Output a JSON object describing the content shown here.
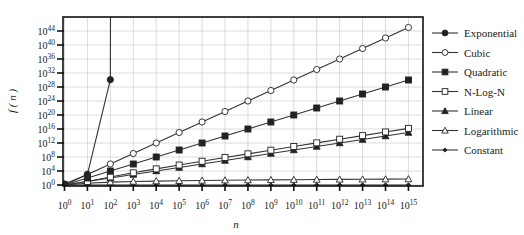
{
  "chart_data": {
    "type": "line",
    "title": "",
    "xlabel": "n",
    "ylabel": "f ( n )",
    "x_scale": "log10",
    "y_scale": "log10",
    "x": [
      0,
      1,
      2,
      3,
      4,
      5,
      6,
      7,
      8,
      9,
      10,
      11,
      12,
      13,
      14,
      15
    ],
    "x_tick_labels": [
      "10^0",
      "10^1",
      "10^2",
      "10^3",
      "10^4",
      "10^5",
      "10^6",
      "10^7",
      "10^8",
      "10^9",
      "10^10",
      "10^11",
      "10^12",
      "10^13",
      "10^14",
      "10^15"
    ],
    "y_ticks": [
      0,
      4,
      8,
      12,
      16,
      20,
      24,
      28,
      32,
      36,
      40,
      44
    ],
    "y_tick_labels": [
      "10^0",
      "10^4",
      "10^8",
      "10^12",
      "10^16",
      "10^20",
      "10^24",
      "10^28",
      "10^32",
      "10^36",
      "10^40",
      "10^44"
    ],
    "xlim": [
      0,
      15.6
    ],
    "ylim_log10": [
      0,
      48.5
    ],
    "grid": true,
    "legend_position": "right",
    "series": [
      {
        "name": "Exponential",
        "marker": "filled-circle",
        "x_log10": [
          0,
          1,
          2,
          2.01
        ],
        "y_log10": [
          0.301,
          3.01,
          30.1,
          60
        ]
      },
      {
        "name": "Cubic",
        "marker": "open-circle",
        "x_log10": [
          0,
          1,
          2,
          3,
          4,
          5,
          6,
          7,
          8,
          9,
          10,
          11,
          12,
          13,
          14,
          15
        ],
        "y_log10": [
          0,
          3,
          6,
          9,
          12,
          15,
          18,
          21,
          24,
          27,
          30,
          33,
          36,
          39,
          42,
          45
        ]
      },
      {
        "name": "Quadratic",
        "marker": "filled-square",
        "x_log10": [
          0,
          1,
          2,
          3,
          4,
          5,
          6,
          7,
          8,
          9,
          10,
          11,
          12,
          13,
          14,
          15
        ],
        "y_log10": [
          0,
          2,
          4,
          6,
          8,
          10,
          12,
          14,
          16,
          18,
          20,
          22,
          24,
          26,
          28,
          30
        ]
      },
      {
        "name": "N-Log-N",
        "marker": "open-square",
        "x_log10": [
          0,
          1,
          2,
          3,
          4,
          5,
          6,
          7,
          8,
          9,
          10,
          11,
          12,
          13,
          14,
          15
        ],
        "y_log10": [
          0,
          1,
          2.3,
          3.48,
          4.6,
          5.7,
          6.78,
          7.85,
          8.9,
          9.95,
          11.0,
          12.04,
          13.08,
          14.11,
          15.15,
          16.18
        ]
      },
      {
        "name": "Linear",
        "marker": "filled-triangle",
        "x_log10": [
          0,
          1,
          2,
          3,
          4,
          5,
          6,
          7,
          8,
          9,
          10,
          11,
          12,
          13,
          14,
          15
        ],
        "y_log10": [
          0,
          1,
          2,
          3,
          4,
          5,
          6,
          7,
          8,
          9,
          10,
          11,
          12,
          13,
          14,
          15
        ]
      },
      {
        "name": "Logarithmic",
        "marker": "open-triangle",
        "x_log10": [
          0,
          1,
          2,
          3,
          4,
          5,
          6,
          7,
          8,
          9,
          10,
          11,
          12,
          13,
          14,
          15
        ],
        "y_log10": [
          0,
          0.52,
          0.82,
          1.0,
          1.12,
          1.22,
          1.3,
          1.37,
          1.42,
          1.47,
          1.52,
          1.56,
          1.6,
          1.63,
          1.67,
          1.7
        ]
      },
      {
        "name": "Constant",
        "marker": "small-filled-diamond",
        "x_log10": [
          0,
          1,
          2,
          3,
          4,
          5,
          6,
          7,
          8,
          9,
          10,
          11,
          12,
          13,
          14,
          15
        ],
        "y_log10": [
          0,
          0,
          0,
          0,
          0,
          0,
          0,
          0,
          0,
          0,
          0,
          0,
          0,
          0,
          0,
          0
        ]
      }
    ]
  },
  "legend": {
    "items": [
      {
        "label": "Exponential",
        "marker": "filled-circle"
      },
      {
        "label": "Cubic",
        "marker": "open-circle"
      },
      {
        "label": "Quadratic",
        "marker": "filled-square"
      },
      {
        "label": "N-Log-N",
        "marker": "open-square"
      },
      {
        "label": "Linear",
        "marker": "filled-triangle"
      },
      {
        "label": "Logarithmic",
        "marker": "open-triangle"
      },
      {
        "label": "Constant",
        "marker": "small-filled-diamond"
      }
    ]
  },
  "colors": {
    "line": "#333333",
    "marker": "#222222",
    "grid": "#cccccc",
    "axis": "#111111",
    "background": "#ffffff"
  }
}
